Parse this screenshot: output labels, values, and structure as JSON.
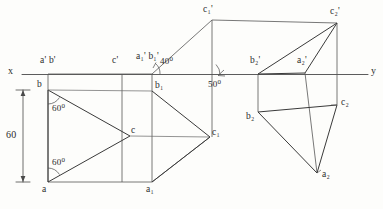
{
  "drawing": {
    "title": "Orthographic projection of triangle ABC with auxiliary views",
    "paper_color": "#fdfdfb",
    "ink_color": "#3a3a3a",
    "axes": {
      "x_label": "x",
      "y_label": "y",
      "line_y": 74,
      "x_start": 22,
      "x_end": 368
    },
    "dimension": {
      "value": "60",
      "x": 22,
      "y_top": 90,
      "y_bottom": 182
    },
    "angles": [
      {
        "name": "angle-60-top",
        "text": "60",
        "unit": "0",
        "x": 52,
        "y": 104
      },
      {
        "name": "angle-60-bottom",
        "text": "60",
        "unit": "0",
        "x": 52,
        "y": 158
      },
      {
        "name": "angle-40",
        "text": "40",
        "unit": "0",
        "x": 160,
        "y": 57
      },
      {
        "name": "angle-50",
        "text": "50",
        "unit": "0",
        "x": 208,
        "y": 80
      }
    ],
    "points": [
      {
        "name": "a-prime-b-prime",
        "label": "a' b'",
        "lx": 40,
        "ly": 56,
        "px": 48,
        "py": 74
      },
      {
        "name": "c-prime",
        "label": "c'",
        "lx": 112,
        "ly": 56,
        "px": 122,
        "py": 74
      },
      {
        "name": "a1-prime-b1-prime",
        "label": "a₁' b₁'",
        "lx": 135,
        "ly": 52,
        "px": 152,
        "py": 74
      },
      {
        "name": "c1-prime",
        "label": "c₁'",
        "lx": 203,
        "ly": 6,
        "px": 212,
        "py": 20
      },
      {
        "name": "b2-prime",
        "label": "b₂'",
        "lx": 250,
        "ly": 56,
        "px": 258,
        "py": 74
      },
      {
        "name": "a2-prime",
        "label": "a₂'",
        "lx": 297,
        "ly": 56,
        "px": 305,
        "py": 74
      },
      {
        "name": "c2-prime",
        "label": "c₂'",
        "lx": 330,
        "ly": 8,
        "px": 337,
        "py": 23
      },
      {
        "name": "b",
        "label": "b",
        "lx": 37,
        "ly": 80,
        "px": 48,
        "py": 90
      },
      {
        "name": "b1",
        "label": "b₁",
        "lx": 155,
        "ly": 81,
        "px": 152,
        "py": 91
      },
      {
        "name": "c",
        "label": "c",
        "lx": 131,
        "ly": 127,
        "px": 130,
        "py": 136
      },
      {
        "name": "c1",
        "label": "c₁",
        "lx": 212,
        "ly": 128,
        "px": 210,
        "py": 137
      },
      {
        "name": "a",
        "label": "a",
        "lx": 42,
        "ly": 186,
        "px": 48,
        "py": 182
      },
      {
        "name": "a1",
        "label": "a₁",
        "lx": 146,
        "ly": 186,
        "px": 152,
        "py": 182
      },
      {
        "name": "b2",
        "label": "b₂",
        "lx": 247,
        "ly": 110,
        "px": 258,
        "py": 112
      },
      {
        "name": "c2",
        "label": "c₂",
        "lx": 341,
        "ly": 98,
        "px": 337,
        "py": 105
      },
      {
        "name": "a2",
        "label": "a₂",
        "lx": 321,
        "ly": 171,
        "px": 317,
        "py": 173
      }
    ],
    "front_view": {
      "name": "front-view-left-box",
      "box": [
        [
          48,
          74
        ],
        [
          152,
          74
        ],
        [
          152,
          182
        ],
        [
          48,
          182
        ]
      ],
      "triangle": [
        [
          48,
          90
        ],
        [
          130,
          136
        ],
        [
          48,
          182
        ]
      ],
      "horizontals": [
        [
          [
            48,
            90
          ],
          [
            152,
            91
          ]
        ],
        [
          [
            130,
            136
          ],
          [
            210,
            137
          ]
        ]
      ]
    },
    "top_view": {
      "name": "top-view-middle-box",
      "box": [
        [
          152,
          74
        ],
        [
          212,
          20
        ],
        [
          212,
          137
        ],
        [
          152,
          182
        ]
      ],
      "triangle": [
        [
          152,
          91
        ],
        [
          210,
          137
        ],
        [
          152,
          182
        ]
      ]
    },
    "aux_upper": {
      "name": "auxiliary-view-upper-right",
      "triangle": [
        [
          258,
          74
        ],
        [
          337,
          23
        ],
        [
          305,
          73
        ]
      ],
      "box_top": [
        [
          212,
          20
        ],
        [
          337,
          23
        ]
      ],
      "verticals": [
        [
          [
            212,
            20
          ],
          [
            212,
            137
          ]
        ],
        [
          [
            337,
            23
          ],
          [
            337,
            105
          ]
        ],
        [
          [
            305,
            73
          ],
          [
            317,
            173
          ]
        ],
        [
          [
            258,
            74
          ],
          [
            258,
            112
          ]
        ]
      ]
    },
    "aux_lower": {
      "name": "auxiliary-view-lower-right",
      "triangle": [
        [
          258,
          112
        ],
        [
          337,
          105
        ],
        [
          317,
          173
        ]
      ]
    }
  }
}
